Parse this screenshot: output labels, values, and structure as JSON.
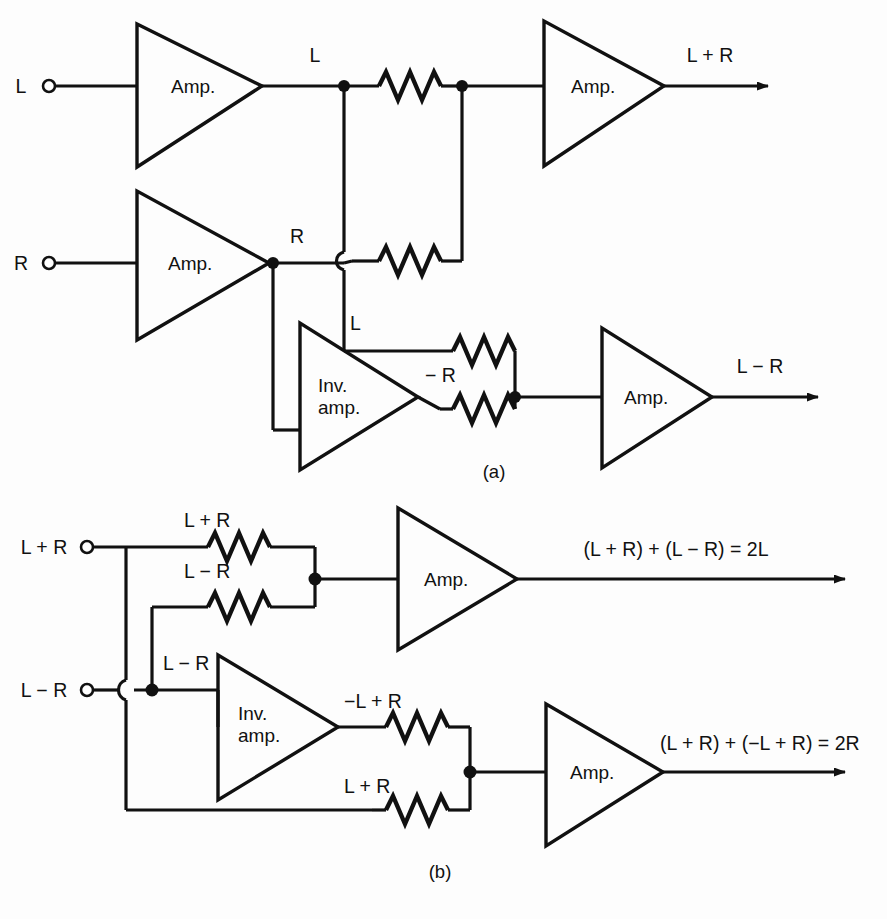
{
  "figure": {
    "panels": [
      {
        "id": "a",
        "letter_label": "(a)"
      },
      {
        "id": "b",
        "letter_label": "(b)"
      }
    ]
  },
  "panel_a": {
    "letter": "(a)",
    "inputs": [
      {
        "name": "input-l",
        "label": "L"
      },
      {
        "name": "input-r",
        "label": "R"
      }
    ],
    "amplifiers": [
      {
        "name": "amp-l-input",
        "label": "Amp."
      },
      {
        "name": "amp-r-input",
        "label": "Amp."
      },
      {
        "name": "amp-sum",
        "label": "Amp."
      },
      {
        "name": "amp-difference",
        "label": "Amp."
      }
    ],
    "inverting_amp": {
      "line1": "Inv.",
      "line2": "amp."
    },
    "node_labels": [
      {
        "name": "node-l",
        "label": "L"
      },
      {
        "name": "node-r",
        "label": "R"
      },
      {
        "name": "node-l-to-diff",
        "label": "L"
      },
      {
        "name": "node-minus-r",
        "label": "− R"
      }
    ],
    "outputs": [
      {
        "name": "output-sum",
        "label": "L + R"
      },
      {
        "name": "output-difference",
        "label": "L − R"
      }
    ]
  },
  "panel_b": {
    "letter": "(b)",
    "inputs": [
      {
        "name": "input-l-plus-r",
        "label": "L + R"
      },
      {
        "name": "input-l-minus-r",
        "label": "L − R"
      }
    ],
    "amplifiers": [
      {
        "name": "amp-left-channel",
        "label": "Amp."
      },
      {
        "name": "amp-right-channel",
        "label": "Amp."
      }
    ],
    "inverting_amp": {
      "line1": "Inv.",
      "line2": "amp."
    },
    "node_labels": [
      {
        "name": "node-sum-top",
        "label": "L + R"
      },
      {
        "name": "node-diff-top",
        "label": "L − R"
      },
      {
        "name": "node-diff-mid",
        "label": "L − R"
      },
      {
        "name": "node-inverted",
        "label": "−L + R"
      },
      {
        "name": "node-sum-bottom",
        "label": "L + R"
      }
    ],
    "outputs": [
      {
        "name": "output-left",
        "label": "(L + R) + (L − R) = 2L"
      },
      {
        "name": "output-right",
        "label": "(L + R) + (−L + R) = 2R"
      }
    ]
  },
  "colors": {
    "ink": "#111111",
    "paper": "#fdfdfd"
  }
}
